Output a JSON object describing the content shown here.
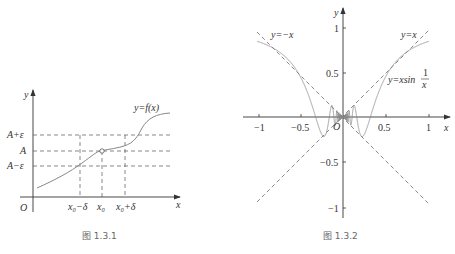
{
  "figure1": {
    "caption": "图 1.3.1",
    "axis": {
      "x_label": "x",
      "y_label": "y",
      "origin": "O"
    },
    "curve_label": "y=f(x)",
    "y_ticks": [
      "A+ε",
      "A",
      "A−ε"
    ],
    "x_ticks": [
      "x₀−δ",
      "x₀",
      "x₀+δ"
    ],
    "colors": {
      "curve": "#888888",
      "axis": "#333333",
      "dash": "#555555"
    }
  },
  "figure2": {
    "caption": "图 1.3.2",
    "axis": {
      "x_label": "x",
      "y_label": "y",
      "origin": "O"
    },
    "labels": {
      "neg_line": "y=−x",
      "pos_line": "y=x",
      "curve": "y=xsin",
      "frac_num": "1",
      "frac_den": "x"
    },
    "x_ticks": [
      "−1",
      "−0.5",
      "0.5",
      "1"
    ],
    "y_ticks": [
      "1",
      "0.5",
      "−0.5",
      "−1"
    ],
    "colors": {
      "curve": "#888888",
      "axis": "#333333",
      "dash": "#555555"
    }
  },
  "chart_data": [
    {
      "type": "line",
      "title": "图 1.3.1",
      "xlabel": "x",
      "ylabel": "y",
      "series": [
        {
          "name": "y=f(x)",
          "description": "increasing S-shaped curve passing through (x0, A) with hollow point at x0"
        }
      ],
      "annotations": [
        "A+ε",
        "A",
        "A−ε",
        "x0−δ",
        "x0",
        "x0+δ",
        "O"
      ]
    },
    {
      "type": "line",
      "title": "图 1.3.2",
      "xlabel": "x",
      "ylabel": "y",
      "xlim": [
        -1,
        1
      ],
      "ylim": [
        -1,
        1
      ],
      "x_ticks": [
        -1,
        -0.5,
        0.5,
        1
      ],
      "y_ticks": [
        -1,
        -0.5,
        0.5,
        1
      ],
      "series": [
        {
          "name": "y=x sin(1/x)",
          "style": "solid"
        },
        {
          "name": "y=x",
          "style": "dashed"
        },
        {
          "name": "y=-x",
          "style": "dashed"
        }
      ]
    }
  ]
}
